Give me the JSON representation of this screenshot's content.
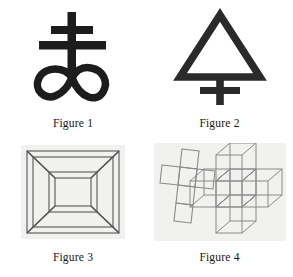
{
  "page": {
    "background_color": "#ffffff",
    "layout": "2x2 figure grid",
    "caption_font_style": "serif"
  },
  "figures": [
    {
      "id": "figure-1",
      "caption": "Figure 1",
      "symbol_name": "leviathan-cross-symbol",
      "description": "Leviathan cross: double-barred cross above an infinity lemniscate",
      "stroke_color": "#1c1c1c",
      "fill_color": "#1c1c1c",
      "background_color": "#ffffff"
    },
    {
      "id": "figure-2",
      "caption": "Figure 2",
      "symbol_name": "alchemical-sulfur-symbol",
      "description": "Triangle above a cross (alchemical sulfur)",
      "stroke_color": "#2a2a2a",
      "fill_color": "none",
      "background_color": "#ffffff"
    },
    {
      "id": "figure-3",
      "caption": "Figure 3",
      "symbol_name": "wireframe-nested-frame",
      "description": "Three-dimensional wireframe square frame drawn in perspective, outer square connected by diagonal edges to an inner square",
      "stroke_color": "#5a5a5a",
      "fill_color": "none",
      "background_color": "#f1f1ef"
    },
    {
      "id": "figure-4",
      "caption": "Figure 4",
      "symbol_name": "cross-net-and-cube-cross",
      "description": "Flat cross-shaped net of squares beside a three-dimensional cross built from wireframe cubes",
      "stroke_color": "#8a8a8a",
      "fill_color": "none",
      "background_color": "#f1f1ef"
    }
  ]
}
